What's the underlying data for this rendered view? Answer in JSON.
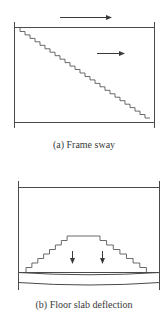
{
  "figures": [
    {
      "id": "a",
      "caption": "(a) Frame sway",
      "elements": {
        "frame": {
          "left_x": 14,
          "right_x": 154,
          "top_y": 27,
          "bottom_y": 122
        },
        "arrows": [
          {
            "direction": "right",
            "x1": 60,
            "x2": 111,
            "y": 17
          },
          {
            "direction": "right",
            "x1": 97,
            "x2": 124,
            "y": 53
          }
        ],
        "crack": {
          "type": "diagonal-staircase",
          "from": [
            20,
            28
          ],
          "to": [
            150,
            118
          ],
          "steps": 26
        }
      }
    },
    {
      "id": "b",
      "caption": "(b) Floor slab deflection",
      "elements": {
        "frame": {
          "left_x": 18,
          "right_x": 159,
          "top_y": 187
        },
        "slab": {
          "top_y": 272,
          "bottom_y": 283,
          "deflected": true
        },
        "arrows": [
          {
            "direction": "down",
            "x": 72,
            "y1": 251,
            "y2": 263
          },
          {
            "direction": "down",
            "x": 102,
            "y1": 251,
            "y2": 263
          }
        ],
        "crack": {
          "type": "stepped-arch",
          "base_left_x": 26,
          "base_right_x": 153,
          "base_y": 272,
          "plateau": [
            73,
            100
          ],
          "plateau_y": 236
        }
      }
    }
  ],
  "colors": {
    "line": "#4a4a4a",
    "crack": "#5a5a5a",
    "caption": "#3a3a3a",
    "background": "#ffffff"
  }
}
